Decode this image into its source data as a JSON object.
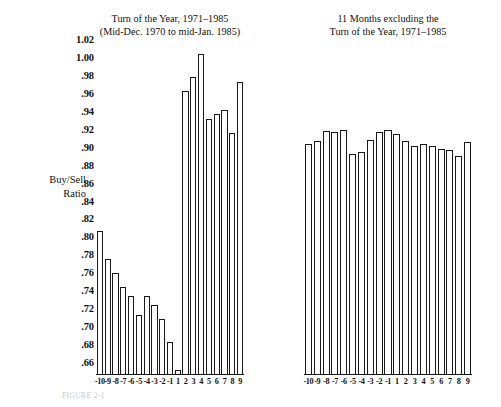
{
  "figure": {
    "axis_label_lines": [
      "Buy/Sell",
      "Ratio"
    ],
    "caption": "FIGURE 2-1",
    "y_ticks": [
      "1.02",
      "1.00",
      ".98",
      ".96",
      ".94",
      ".92",
      ".90",
      ".88",
      ".86",
      ".84",
      ".82",
      ".80",
      ".78",
      ".76",
      ".74",
      ".72",
      ".70",
      ".68",
      ".66"
    ],
    "ink_color": "#1a1a1a",
    "bar_fill": "#ffffff",
    "background": "#ffffff"
  },
  "chart_data": [
    {
      "type": "bar",
      "title": "Turn of the Year, 1971–1985",
      "subtitle": "(Mid-Dec. 1970 to mid-Jan. 1985)",
      "xlabel": "",
      "ylabel": "Buy/Sell Ratio",
      "ylim": [
        0.66,
        1.02
      ],
      "grid": false,
      "legend": "none",
      "categories": [
        "-10",
        "-9",
        "-8",
        "-7",
        "-6",
        "-5",
        "-4",
        "-3",
        "-2",
        "-1",
        "1",
        "2",
        "3",
        "4",
        "5",
        "6",
        "7",
        "8",
        "9"
      ],
      "values": [
        0.815,
        0.785,
        0.77,
        0.755,
        0.745,
        0.725,
        0.745,
        0.735,
        0.72,
        0.695,
        0.665,
        0.965,
        0.98,
        1.005,
        0.935,
        0.94,
        0.945,
        0.92,
        0.975
      ]
    },
    {
      "type": "bar",
      "title": "11 Months excluding the",
      "subtitle": "Turn of the Year, 1971–1985",
      "xlabel": "",
      "ylabel": "Buy/Sell Ratio",
      "ylim": [
        0.66,
        1.02
      ],
      "grid": false,
      "legend": "none",
      "categories": [
        "-10",
        "-9",
        "-8",
        "-7",
        "-6",
        "-5",
        "-4",
        "-3",
        "-2",
        "-1",
        "1",
        "2",
        "3",
        "4",
        "5",
        "6",
        "7",
        "8",
        "9"
      ],
      "values": [
        0.908,
        0.912,
        0.922,
        0.921,
        0.923,
        0.898,
        0.9,
        0.913,
        0.921,
        0.923,
        0.919,
        0.911,
        0.906,
        0.908,
        0.906,
        0.903,
        0.902,
        0.895,
        0.91
      ]
    }
  ]
}
